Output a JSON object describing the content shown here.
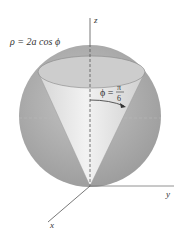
{
  "diagram": {
    "equation_label": "ρ = 2a cos ϕ",
    "angle_label": {
      "lhs": "ϕ =",
      "numerator": "π",
      "denominator": "6"
    },
    "axes": {
      "z": "z",
      "y": "y",
      "x": "x"
    },
    "colors": {
      "sphere": "#a9a9a9",
      "sphere_highlight": "#c8c8c8",
      "cone": "#e2e2e2",
      "cone_top": "#c9c9c9",
      "axis": "#555555"
    }
  }
}
